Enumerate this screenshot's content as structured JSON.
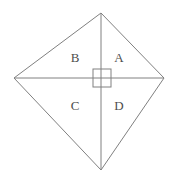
{
  "figure": {
    "name": "kite-quadrilateral-divided-into-four-regions",
    "background_color": "#ffffff",
    "stroke_color": "#808080",
    "stroke_width": 1,
    "label_color": "#4d4d4d",
    "canvas": {
      "width": 172,
      "height": 176
    }
  },
  "vertices": {
    "top": {
      "label": "top-vertex",
      "x": 101,
      "y": 13
    },
    "left": {
      "label": "left-vertex",
      "x": 14,
      "y": 78
    },
    "right": {
      "label": "right-vertex",
      "x": 164,
      "y": 78
    },
    "bottom": {
      "label": "bottom-vertex",
      "x": 101,
      "y": 170
    }
  },
  "diagonals": {
    "horizontal": {
      "x1": 14,
      "y1": 78,
      "x2": 164,
      "y2": 78
    },
    "vertical": {
      "x1": 101,
      "y1": 13,
      "x2": 101,
      "y2": 170
    }
  },
  "right_angle_marker": {
    "x": 93,
    "y": 69,
    "width": 18,
    "height": 18
  },
  "labels": [
    {
      "text": "B",
      "x": 75,
      "y": 58,
      "region": "upper-left"
    },
    {
      "text": "A",
      "x": 119,
      "y": 58,
      "region": "upper-right"
    },
    {
      "text": "C",
      "x": 75,
      "y": 106,
      "region": "lower-left"
    },
    {
      "text": "D",
      "x": 119,
      "y": 106,
      "region": "lower-right"
    }
  ]
}
